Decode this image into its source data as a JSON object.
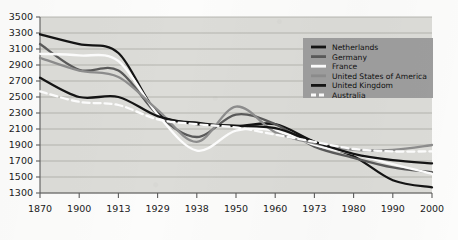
{
  "chart_data": {
    "type": "line",
    "title": "",
    "subtitle": "",
    "xlabel": "",
    "ylabel": "",
    "categories": [
      "1870",
      "1900",
      "1913",
      "1929",
      "1938",
      "1950",
      "1960",
      "1973",
      "1980",
      "1990",
      "2000"
    ],
    "yticks": [
      1300,
      1500,
      1700,
      1900,
      2100,
      2300,
      2500,
      2700,
      2900,
      3100,
      3300,
      3500
    ],
    "ylim": [
      1300,
      3500
    ],
    "grid": "horizontal",
    "legend_position": "upper-right",
    "series": [
      {
        "name": "Netherlands",
        "color": "#141414",
        "style": "solid",
        "values": [
          3284,
          3160,
          3050,
          2300,
          2180,
          2140,
          2160,
          1940,
          1760,
          1460,
          1370
        ]
      },
      {
        "name": "Germany",
        "color": "#5a5a5a",
        "style": "solid",
        "values": [
          3162,
          2840,
          2830,
          2280,
          2000,
          2280,
          2160,
          1880,
          1740,
          1620,
          1560
        ]
      },
      {
        "name": "France",
        "color": "#fdfdfd",
        "style": "solid",
        "values": [
          3040,
          3020,
          2950,
          2280,
          1830,
          2080,
          2080,
          1900,
          1790,
          1660,
          1540
        ]
      },
      {
        "name": "United States of America",
        "color": "#8d8d8d",
        "style": "solid",
        "values": [
          2990,
          2830,
          2750,
          2340,
          1940,
          2380,
          2060,
          1920,
          1840,
          1840,
          1900
        ]
      },
      {
        "name": "United Kingdom",
        "color": "#141414",
        "style": "solid",
        "values": [
          2740,
          2500,
          2500,
          2260,
          2160,
          2140,
          2110,
          1940,
          1790,
          1710,
          1670
        ]
      },
      {
        "name": "Australia",
        "color": "#fdfdfd",
        "style": "dashed",
        "values": [
          2570,
          2440,
          2400,
          2220,
          2160,
          2120,
          2030,
          1940,
          1850,
          1820,
          1820
        ]
      }
    ]
  },
  "axes": {
    "y_tick_labels": [
      "3500",
      "3300",
      "3100",
      "2900",
      "2700",
      "2500",
      "2300",
      "2100",
      "1900",
      "1700",
      "1500",
      "1300"
    ],
    "x_tick_labels": [
      "1870",
      "1900",
      "1913",
      "1929",
      "1938",
      "1950",
      "1960",
      "1973",
      "1980",
      "1990",
      "2000"
    ]
  },
  "legend": {
    "entries": [
      {
        "label": "Netherlands"
      },
      {
        "label": "Germany"
      },
      {
        "label": "France"
      },
      {
        "label": "United States of America"
      },
      {
        "label": "United Kingdom"
      },
      {
        "label": "Australia"
      }
    ]
  },
  "colors": {
    "plot_background": "#dcdcd8",
    "gridline": "#a9a9a5",
    "axis": "#5c5c5c",
    "legend_background": "#9e9e9e",
    "page_background": "#fcfcfb"
  }
}
